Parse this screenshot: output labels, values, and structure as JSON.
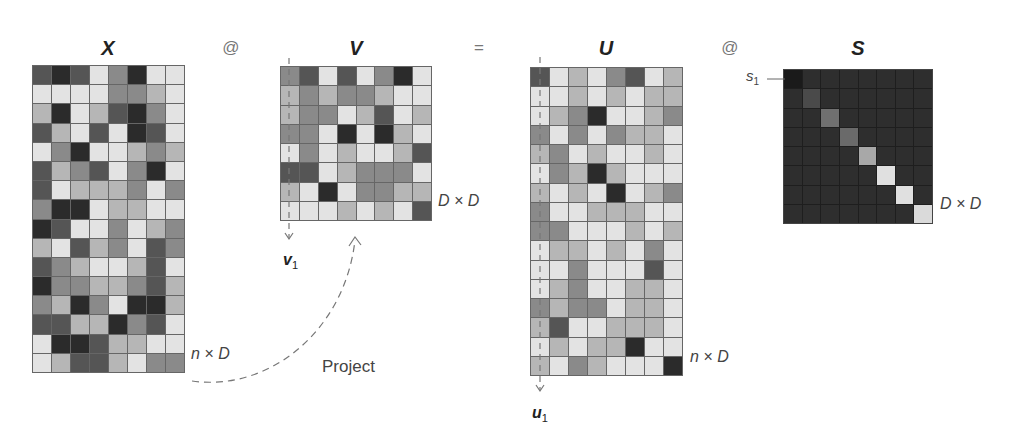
{
  "diagram": {
    "palette": {
      "1": "#e3e3e3",
      "2": "#b6b6b6",
      "3": "#8a8a8a",
      "4": "#555555",
      "5": "#2b2b2b"
    },
    "operators": {
      "op1": "@",
      "op2": "=",
      "op3": "@"
    },
    "project_label": "Project",
    "s_label": {
      "base": "s",
      "sub": "1"
    },
    "matrices": {
      "X": {
        "title": "X",
        "dim_label": "n × D",
        "rows": 16,
        "cols": 8,
        "cells": [
          [
            4,
            5,
            4,
            1,
            3,
            5,
            1,
            1
          ],
          [
            1,
            1,
            1,
            1,
            3,
            3,
            2,
            1
          ],
          [
            2,
            5,
            1,
            2,
            4,
            5,
            3,
            1
          ],
          [
            4,
            2,
            1,
            4,
            1,
            5,
            4,
            1
          ],
          [
            1,
            3,
            5,
            1,
            1,
            2,
            3,
            2
          ],
          [
            4,
            2,
            3,
            4,
            1,
            3,
            5,
            1
          ],
          [
            4,
            1,
            2,
            2,
            2,
            3,
            1,
            3
          ],
          [
            3,
            5,
            5,
            1,
            2,
            2,
            1,
            1
          ],
          [
            5,
            4,
            1,
            1,
            3,
            1,
            2,
            3
          ],
          [
            2,
            1,
            4,
            2,
            3,
            1,
            4,
            3
          ],
          [
            4,
            3,
            2,
            1,
            1,
            2,
            4,
            1
          ],
          [
            5,
            3,
            3,
            2,
            2,
            3,
            4,
            2
          ],
          [
            3,
            2,
            5,
            3,
            1,
            5,
            5,
            2
          ],
          [
            4,
            4,
            2,
            2,
            5,
            3,
            4,
            1
          ],
          [
            1,
            5,
            5,
            4,
            2,
            2,
            1,
            1
          ],
          [
            1,
            2,
            4,
            4,
            2,
            1,
            3,
            3
          ]
        ]
      },
      "V": {
        "title": "V",
        "dim_label": "D × D",
        "vector_label": {
          "base": "v",
          "sub": "1"
        },
        "rows": 8,
        "cols": 8,
        "cells": [
          [
            3,
            4,
            1,
            4,
            1,
            3,
            5,
            1
          ],
          [
            2,
            3,
            2,
            3,
            3,
            2,
            1,
            1
          ],
          [
            2,
            3,
            3,
            1,
            2,
            4,
            1,
            2
          ],
          [
            3,
            3,
            1,
            5,
            1,
            5,
            2,
            1
          ],
          [
            1,
            3,
            1,
            2,
            1,
            1,
            2,
            4
          ],
          [
            4,
            4,
            1,
            2,
            3,
            3,
            3,
            1
          ],
          [
            2,
            1,
            5,
            1,
            3,
            3,
            2,
            2
          ],
          [
            1,
            1,
            1,
            2,
            1,
            2,
            1,
            4
          ]
        ]
      },
      "U": {
        "title": "U",
        "dim_label": "n × D",
        "vector_label": {
          "base": "u",
          "sub": "1"
        },
        "rows": 16,
        "cols": 8,
        "cells": [
          [
            4,
            1,
            2,
            1,
            3,
            4,
            1,
            2
          ],
          [
            1,
            1,
            2,
            1,
            2,
            1,
            2,
            2
          ],
          [
            1,
            2,
            3,
            5,
            1,
            1,
            2,
            3
          ],
          [
            3,
            1,
            3,
            1,
            3,
            2,
            2,
            1
          ],
          [
            2,
            3,
            1,
            2,
            1,
            1,
            2,
            1
          ],
          [
            1,
            3,
            2,
            5,
            2,
            1,
            1,
            1
          ],
          [
            2,
            1,
            2,
            1,
            5,
            1,
            2,
            3
          ],
          [
            3,
            1,
            1,
            2,
            2,
            2,
            1,
            1
          ],
          [
            3,
            3,
            1,
            1,
            1,
            2,
            1,
            2
          ],
          [
            1,
            2,
            2,
            1,
            2,
            1,
            3,
            1
          ],
          [
            1,
            1,
            3,
            1,
            1,
            1,
            4,
            1
          ],
          [
            1,
            2,
            3,
            1,
            1,
            2,
            2,
            1
          ],
          [
            3,
            2,
            3,
            3,
            1,
            2,
            2,
            1
          ],
          [
            2,
            4,
            1,
            1,
            2,
            2,
            2,
            1
          ],
          [
            1,
            2,
            1,
            2,
            2,
            5,
            1,
            1
          ],
          [
            2,
            1,
            3,
            2,
            1,
            1,
            1,
            5
          ]
        ]
      },
      "S": {
        "title": "S",
        "dim_label": "D × D",
        "rows": 8,
        "cols": 8,
        "off_diagonal_color": "#2e2e2e",
        "diagonal_colors": [
          "#1a1a1a",
          "#4a4a4a",
          "#707070",
          "#6a6a6a",
          "#a8a8a8",
          "#e0e0e0",
          "#e0e0e0",
          "#dadada"
        ]
      }
    }
  }
}
